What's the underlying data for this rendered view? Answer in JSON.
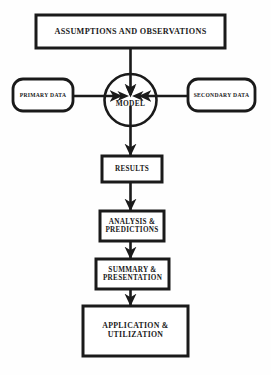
{
  "diagram": {
    "type": "flowchart",
    "background_color": "#fefefe",
    "stroke_color": "#1a1a1a",
    "fill_color": "#ffffff",
    "nodes": [
      {
        "id": "assumptions",
        "label": "ASSUMPTIONS AND OBSERVATIONS",
        "shape": "rectangle",
        "x": 36,
        "y": 15,
        "width": 189,
        "height": 33
      },
      {
        "id": "primary-data",
        "label": "PRIMARY DATA",
        "shape": "rounded-rectangle",
        "x": 13,
        "y": 79,
        "width": 60,
        "height": 32
      },
      {
        "id": "secondary-data",
        "label": "SECONDARY DATA",
        "shape": "rounded-rectangle",
        "x": 188,
        "y": 79,
        "width": 67,
        "height": 32
      },
      {
        "id": "model",
        "label": "MODEL",
        "shape": "circle",
        "cx": 130,
        "cy": 100,
        "r": 26
      },
      {
        "id": "results",
        "label": "RESULTS",
        "shape": "rectangle",
        "x": 102,
        "y": 156,
        "width": 60,
        "height": 26
      },
      {
        "id": "analysis-predictions",
        "label": "ANALYSIS &\nPREDICTIONS",
        "shape": "rectangle",
        "x": 100,
        "y": 211,
        "width": 64,
        "height": 30
      },
      {
        "id": "summary-presentation",
        "label": "SUMMARY &\nPRESENTATION",
        "shape": "rectangle",
        "x": 96,
        "y": 259,
        "width": 73,
        "height": 30
      },
      {
        "id": "application-utilization",
        "label": "APPLICATION &\nUTILIZATION",
        "shape": "rectangle",
        "x": 83,
        "y": 306,
        "width": 105,
        "height": 50
      }
    ],
    "edges": [
      {
        "id": "assumptions-to-model",
        "from": "assumptions",
        "to": "model",
        "direction": "down",
        "arrowhead": true
      },
      {
        "id": "primary-to-model",
        "from": "primary-data",
        "to": "model",
        "direction": "right",
        "arrowhead": true
      },
      {
        "id": "secondary-to-model",
        "from": "secondary-data",
        "to": "model",
        "direction": "left",
        "arrowhead": true
      },
      {
        "id": "model-to-results",
        "from": "model",
        "to": "results",
        "direction": "down",
        "arrowhead": true
      },
      {
        "id": "results-to-analysis",
        "from": "results",
        "to": "analysis-predictions",
        "direction": "down",
        "arrowhead": true
      },
      {
        "id": "analysis-to-summary",
        "from": "analysis-predictions",
        "to": "summary-presentation",
        "direction": "down",
        "arrowhead": true
      },
      {
        "id": "summary-to-application",
        "from": "summary-presentation",
        "to": "application-utilization",
        "direction": "down",
        "arrowhead": true
      }
    ]
  }
}
